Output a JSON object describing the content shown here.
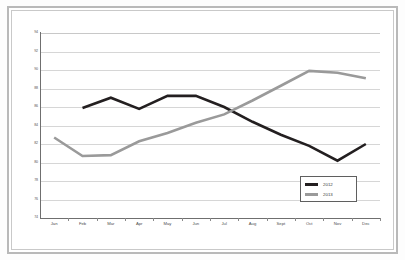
{
  "chart_data": {
    "type": "line",
    "title": "",
    "xlabel": "",
    "ylabel": "",
    "categories": [
      "Jan",
      "Feb",
      "Mar",
      "Apr",
      "May",
      "Jun",
      "Jul",
      "Aug",
      "Sept",
      "Oct",
      "Nov",
      "Dec"
    ],
    "ylim": [
      74,
      94
    ],
    "yticks": [
      74,
      76,
      78,
      80,
      82,
      84,
      86,
      88,
      90,
      92,
      94
    ],
    "ytick_labels": [
      "74",
      "76",
      "78",
      "80",
      "82",
      "84",
      "86",
      "88",
      "90",
      "92",
      "94"
    ],
    "grid": true,
    "legend_position": "bottom-right",
    "series": [
      {
        "name": "2012",
        "color": "#231f20",
        "values": [
          null,
          85.9,
          87.0,
          85.8,
          87.2,
          87.2,
          86.0,
          84.4,
          83.0,
          81.8,
          80.2,
          82.0
        ]
      },
      {
        "name": "2013",
        "color": "#9a9a9a",
        "values": [
          82.7,
          80.7,
          80.8,
          82.3,
          83.2,
          84.3,
          85.2,
          86.7,
          88.3,
          89.9,
          89.7,
          89.1
        ]
      }
    ]
  },
  "legend": {
    "entries": [
      {
        "label": "2012",
        "color": "#231f20"
      },
      {
        "label": "2013",
        "color": "#9a9a9a"
      }
    ]
  },
  "colors": {
    "series_2012": "#231f20",
    "series_2013": "#9a9a9a",
    "gridline": "#d6d6d6",
    "axis": "#6f6f6f",
    "frame": "#b9b9b9",
    "background": "#ffffff"
  }
}
